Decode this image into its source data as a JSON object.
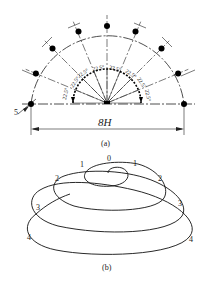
{
  "figure_a": {
    "caption": "(a)",
    "dimension_label": "8H",
    "offset_label": "5",
    "angle_labels": [
      "22.5°",
      "22.5°",
      "22.5°",
      "22.5°",
      "22.5°",
      "22.5°",
      "22.5°",
      "22.5°"
    ],
    "outer_points": 9,
    "colors": {
      "line": "#222222",
      "dot": "#000000"
    }
  },
  "figure_b": {
    "caption": "(b)",
    "spiral_labels": {
      "top": "0",
      "left": [
        "1",
        "2",
        "3",
        "4"
      ],
      "right": [
        "1",
        "2",
        "3",
        "4"
      ]
    }
  }
}
